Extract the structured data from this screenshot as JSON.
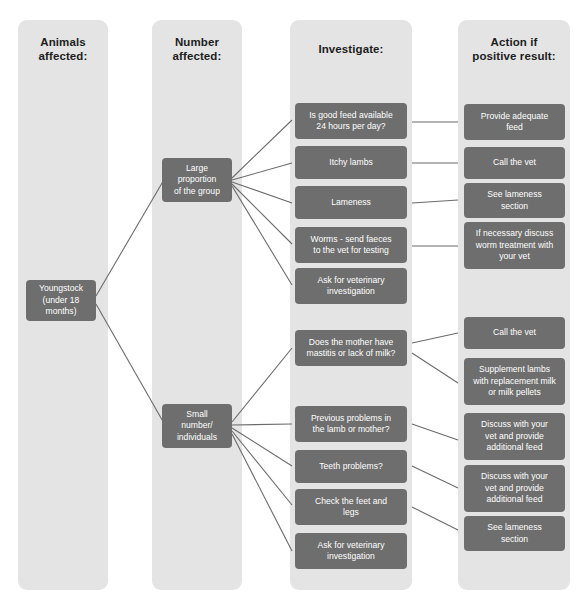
{
  "diagram": {
    "accent_color": "#6e6e6e",
    "column_color": "#e4e4e4",
    "link_color": "#6b6b6b"
  },
  "columns": [
    {
      "id": "animals",
      "title": "Animals\naffected:"
    },
    {
      "id": "number",
      "title": "Number\naffected:"
    },
    {
      "id": "investigate",
      "title": "Investigate:"
    },
    {
      "id": "action",
      "title": "Action if\npositive result:"
    }
  ],
  "nodes": {
    "animals": [
      {
        "id": "youngstock",
        "label": "Youngstock\n(under 18\nmonths)"
      }
    ],
    "number": [
      {
        "id": "large-proportion",
        "label": "Large\nproportion\nof the group"
      },
      {
        "id": "small-number",
        "label": "Small\nnumber/\nindividuals"
      }
    ],
    "investigate": [
      {
        "id": "good-feed",
        "label": "Is good feed available\n24 hours per day?"
      },
      {
        "id": "itchy-lambs",
        "label": "Itchy lambs"
      },
      {
        "id": "lameness",
        "label": "Lameness"
      },
      {
        "id": "worms",
        "label": "Worms - send faeces\nto the vet for testing"
      },
      {
        "id": "ask-vet-1",
        "label": "Ask for veterinary\ninvestigation"
      },
      {
        "id": "mother-mastitis",
        "label": "Does the mother have\nmastitis or lack of milk?"
      },
      {
        "id": "previous-problems",
        "label": "Previous problems in\nthe lamb or mother?"
      },
      {
        "id": "teeth-problems",
        "label": "Teeth problems?"
      },
      {
        "id": "check-feet",
        "label": "Check the feet and\nlegs"
      },
      {
        "id": "ask-vet-2",
        "label": "Ask for veterinary\ninvestigation"
      }
    ],
    "action": [
      {
        "id": "provide-feed",
        "label": "Provide adequate\nfeed"
      },
      {
        "id": "call-vet-1",
        "label": "Call the vet"
      },
      {
        "id": "see-lameness-1",
        "label": "See lameness\nsection"
      },
      {
        "id": "worm-treatment",
        "label": "If necessary discuss\nworm treatment with\nyour vet"
      },
      {
        "id": "call-vet-2",
        "label": "Call the vet"
      },
      {
        "id": "supplement-lambs",
        "label": "Supplement lambs\nwith replacement milk\nor milk pellets"
      },
      {
        "id": "discuss-vet-1",
        "label": "Discuss with your\nvet and provide\nadditional feed"
      },
      {
        "id": "discuss-vet-2",
        "label": "Discuss with your\nvet and provide\nadditional feed"
      },
      {
        "id": "see-lameness-2",
        "label": "See lameness\nsection"
      }
    ]
  }
}
